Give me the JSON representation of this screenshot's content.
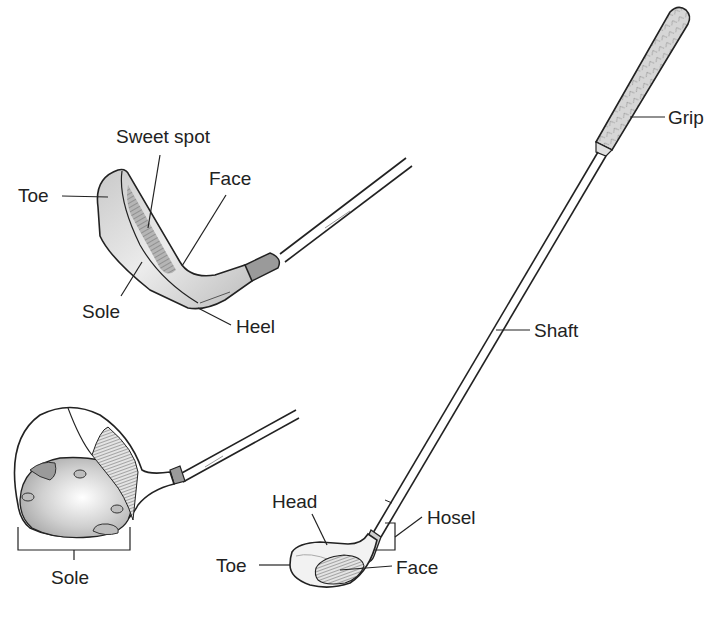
{
  "diagram": {
    "colors": {
      "ink": "#222222",
      "metal_light": "#e6e6e6",
      "metal_mid": "#bdbdbd",
      "metal_dark": "#8a8a8a",
      "background": "#ffffff"
    },
    "iron": {
      "labels": {
        "sweet_spot": "Sweet spot",
        "toe": "Toe",
        "face": "Face",
        "sole": "Sole",
        "heel": "Heel"
      }
    },
    "wood_sole_view": {
      "labels": {
        "sole": "Sole"
      }
    },
    "full_club": {
      "labels": {
        "grip": "Grip",
        "shaft": "Shaft",
        "head": "Head",
        "hosel": "Hosel",
        "toe": "Toe",
        "face": "Face"
      }
    }
  }
}
